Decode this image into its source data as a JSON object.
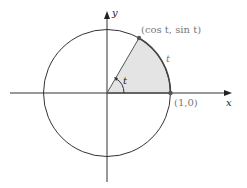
{
  "diagram": {
    "type": "unit-circle",
    "labels": {
      "y_axis": "y",
      "x_axis": "x",
      "point_on_circle": "(cos t, sin t)",
      "arc_label": "t",
      "angle_label": "t",
      "point_on_axis": "(1,0)"
    },
    "colors": {
      "stroke": "#333333",
      "shade": "#e4e4e4",
      "label_gray": "#777777"
    },
    "angle_degrees": 60
  }
}
